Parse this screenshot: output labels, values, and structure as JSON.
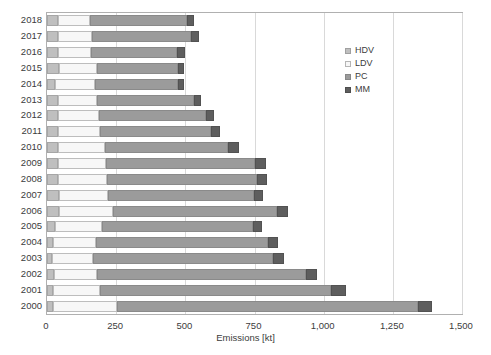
{
  "chart_data": {
    "type": "bar",
    "orientation": "horizontal",
    "stacked": true,
    "title": "",
    "subtitle": "",
    "xlabel": "Emissions [kt]",
    "ylabel": "",
    "xlim": [
      0,
      1500
    ],
    "xticks": [
      0,
      250,
      500,
      750,
      1000,
      1250,
      1500
    ],
    "xtick_labels": [
      "0",
      "250",
      "500",
      "750",
      "1,000",
      "1,250",
      "1,500"
    ],
    "grid": true,
    "grid_axis": "x",
    "legend_position": "inside-top-right",
    "categories": [
      "2018",
      "2017",
      "2016",
      "2015",
      "2014",
      "2013",
      "2012",
      "2011",
      "2010",
      "2009",
      "2008",
      "2007",
      "2006",
      "2005",
      "2004",
      "2003",
      "2002",
      "2001",
      "2000"
    ],
    "series": [
      {
        "name": "HDV",
        "color": "#bfbfbf",
        "values": [
          40,
          40,
          40,
          42,
          30,
          38,
          38,
          40,
          38,
          38,
          38,
          42,
          42,
          30,
          20,
          18,
          25,
          22,
          22
        ]
      },
      {
        "name": "LDV",
        "color": "#f7f7f7",
        "values": [
          115,
          122,
          120,
          140,
          142,
          142,
          150,
          152,
          170,
          175,
          180,
          180,
          195,
          168,
          158,
          150,
          155,
          170,
          230
        ]
      },
      {
        "name": "PC",
        "color": "#9b9b9b",
        "values": [
          350,
          358,
          310,
          290,
          300,
          350,
          385,
          400,
          445,
          540,
          540,
          525,
          595,
          545,
          620,
          650,
          755,
          835,
          1090
        ]
      },
      {
        "name": "MM",
        "color": "#5e5e5e",
        "values": [
          25,
          28,
          28,
          22,
          22,
          28,
          32,
          32,
          40,
          40,
          38,
          35,
          38,
          35,
          38,
          38,
          40,
          55,
          50
        ]
      }
    ],
    "totals": [
      530,
      548,
      498,
      494,
      494,
      558,
      605,
      624,
      693,
      793,
      796,
      782,
      870,
      778,
      836,
      856,
      975,
      1082,
      1392
    ]
  },
  "legend": {
    "items": [
      {
        "label": "HDV",
        "swatch": "hdv-swatch"
      },
      {
        "label": "LDV",
        "swatch": "ldv-swatch"
      },
      {
        "label": "PC",
        "swatch": "pc-swatch"
      },
      {
        "label": "MM",
        "swatch": "mm-swatch"
      }
    ]
  }
}
